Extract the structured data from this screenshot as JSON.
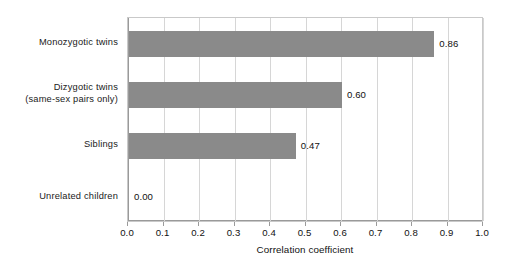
{
  "chart_data": {
    "type": "bar",
    "orientation": "horizontal",
    "title": "",
    "xlabel": "Correlation coefficient",
    "ylabel": "",
    "xlim": [
      0.0,
      1.0
    ],
    "grid": true,
    "legend": null,
    "categories": [
      "Monozygotic twins",
      "Dizygotic twins (same-sex pairs only)",
      "Siblings",
      "Unrelated children"
    ],
    "category_lines": [
      [
        "Monozygotic twins"
      ],
      [
        "Dizygotic twins",
        "(same-sex pairs only)"
      ],
      [
        "Siblings"
      ],
      [
        "Unrelated children"
      ]
    ],
    "values": [
      0.86,
      0.6,
      0.47,
      0.0
    ],
    "value_labels": [
      "0.86",
      "0.60",
      "0.47",
      "0.00"
    ],
    "xticks": [
      0.0,
      0.1,
      0.2,
      0.3,
      0.4,
      0.5,
      0.6,
      0.7,
      0.8,
      0.9,
      1.0
    ],
    "xtick_labels": [
      "0.0",
      "0.1",
      "0.2",
      "0.3",
      "0.4",
      "0.5",
      "0.6",
      "0.7",
      "0.8",
      "0.9",
      "1.0"
    ],
    "colors": {
      "bar": "#8a8a8a",
      "grid": "#d6d6d6",
      "axis": "#9a9a9a",
      "text": "#111111",
      "background": "#ffffff"
    }
  }
}
